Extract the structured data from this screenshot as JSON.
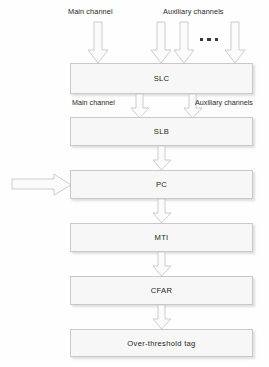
{
  "diagram": {
    "background_color": "#fefefe",
    "box_fill_color": "#f7f7f7",
    "box_border_color": "#c9c9c9",
    "arrow_fill_color": "#fbfbfb",
    "arrow_border_color": "#c4c4c4",
    "text_color": "#262626",
    "input_labels": {
      "main": "Main channel",
      "auxiliary": "Auxiliary channels"
    },
    "intermediate_labels": {
      "main": "Main channel",
      "auxiliary": "Auxiliary channels"
    },
    "ellipsis": "▪ ▪ ▪",
    "blocks": [
      {
        "id": "slc",
        "label": "SLC"
      },
      {
        "id": "slb",
        "label": "SLB"
      },
      {
        "id": "pc",
        "label": "PC"
      },
      {
        "id": "mti",
        "label": "MTI"
      },
      {
        "id": "cfar",
        "label": "CFAR"
      },
      {
        "id": "output",
        "label": "Over-threshold tag"
      }
    ],
    "flow": {
      "input_arrows_top": 4,
      "main_to_slc": 1,
      "aux_to_slc": 3,
      "slc_to_slb": 2,
      "slb_to_pc": 1,
      "external_into_pc": 1,
      "pc_to_mti": 1,
      "mti_to_cfar": 1,
      "cfar_to_output": 1
    }
  }
}
